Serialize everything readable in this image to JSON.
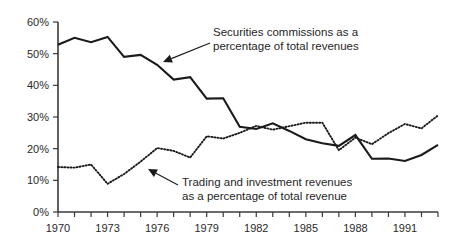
{
  "chart_data": {
    "type": "line",
    "title": "",
    "subtitle": "",
    "xlabel": "",
    "ylabel": "",
    "xlim": [
      1970,
      1993
    ],
    "ylim": [
      0,
      60
    ],
    "grid": false,
    "legend_position": "inline-annotations",
    "x": [
      1970,
      1971,
      1972,
      1973,
      1974,
      1975,
      1976,
      1977,
      1978,
      1979,
      1980,
      1981,
      1982,
      1983,
      1984,
      1985,
      1986,
      1987,
      1988,
      1989,
      1990,
      1991,
      1992,
      1993
    ],
    "x_tick_labels": [
      "1970",
      "1973",
      "1976",
      "1979",
      "1982",
      "1985",
      "1988",
      "1991"
    ],
    "x_tick_values": [
      1970,
      1973,
      1976,
      1979,
      1982,
      1985,
      1988,
      1991
    ],
    "y_tick_labels": [
      "0%",
      "10%",
      "20%",
      "30%",
      "40%",
      "50%",
      "60%"
    ],
    "y_tick_values": [
      0,
      10,
      20,
      30,
      40,
      50,
      60
    ],
    "series": [
      {
        "name": "Securities commissions as a percentage of total revenues",
        "style": "solid",
        "color": "#1a1a1a",
        "values": [
          52.8,
          55.0,
          53.6,
          55.3,
          49.0,
          49.6,
          46.5,
          41.8,
          42.6,
          35.8,
          35.9,
          26.9,
          26.2,
          28.0,
          25.6,
          23.0,
          21.7,
          20.9,
          24.3,
          16.8,
          16.9,
          16.1,
          18.0,
          21.2
        ]
      },
      {
        "name": "Trading and investment revenues as a percentage of total revenue",
        "style": "dotted",
        "color": "#1a1a1a",
        "values": [
          14.2,
          14.0,
          15.0,
          8.9,
          12.0,
          15.9,
          20.2,
          19.3,
          17.2,
          23.9,
          23.2,
          25.0,
          27.2,
          26.0,
          27.1,
          28.2,
          28.2,
          19.5,
          23.5,
          21.4,
          24.9,
          27.8,
          26.4,
          30.5
        ]
      }
    ],
    "annotations": [
      {
        "id": "securities-annotation",
        "line1": "Securities commissions as a",
        "line2": "percentage of total revenues",
        "text_x": 213,
        "text_y": 36,
        "leader_from_x": 210,
        "leader_from_y": 43,
        "leader_to_x": 163,
        "leader_to_y": 62
      },
      {
        "id": "trading-annotation",
        "line1": "Trading and investment revenues",
        "line2": "as a percentage of total revenue",
        "text_x": 182,
        "text_y": 186,
        "leader_from_x": 178,
        "leader_from_y": 185,
        "leader_to_x": 148,
        "leader_to_y": 169
      }
    ]
  }
}
